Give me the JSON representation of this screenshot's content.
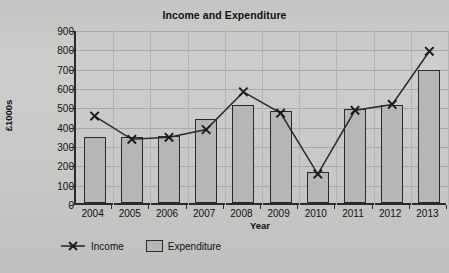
{
  "page": {
    "top_partial_text": "",
    "bottom_partial_text": ""
  },
  "chart_data": {
    "type": "bar",
    "title": "Income and Expenditure",
    "xlabel": "Year",
    "ylabel": "£1000s",
    "categories": [
      "2004",
      "2005",
      "2006",
      "2007",
      "2008",
      "2009",
      "2010",
      "2011",
      "2012",
      "2013"
    ],
    "ylim": [
      0,
      900
    ],
    "ytick_step": 100,
    "yticks": [
      "900",
      "800",
      "700",
      "600",
      "500",
      "400",
      "300",
      "200",
      "100",
      "0"
    ],
    "grid": true,
    "legend_position": "bottom-left",
    "series": [
      {
        "name": "Income",
        "render": "line",
        "marker": "x",
        "color": "#2a2a2a",
        "values": [
          460,
          340,
          350,
          390,
          585,
          475,
          160,
          490,
          520,
          795
        ]
      },
      {
        "name": "Expenditure",
        "render": "bar",
        "color": "#b6b6b4",
        "edge_color": "#2a2a2a",
        "values": [
          340,
          340,
          345,
          435,
          505,
          475,
          160,
          485,
          505,
          690
        ]
      }
    ]
  }
}
